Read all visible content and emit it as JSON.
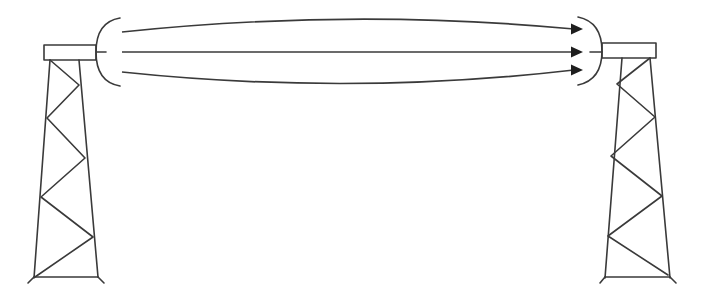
{
  "diagram": {
    "title": "",
    "colors": {
      "line": "#3a3a3a",
      "arrowhead": "#1e1e1e",
      "background": "#ffffff"
    },
    "left_tower": {
      "role": "transmitter-tower",
      "crossarm": {
        "x": 44,
        "y": 45,
        "w": 52,
        "h": 15
      },
      "legs": [
        [
          50,
          60,
          34,
          278
        ],
        [
          79,
          60,
          98,
          277
        ]
      ],
      "base": [
        34,
        277,
        98,
        277
      ],
      "feet": [
        [
          34,
          277,
          28,
          283
        ],
        [
          98,
          277,
          104,
          283
        ]
      ],
      "lattice_zigzag": [
        [
          50,
          60
        ],
        [
          79,
          85
        ],
        [
          47,
          118
        ],
        [
          85,
          158
        ],
        [
          41,
          197
        ],
        [
          93,
          237
        ],
        [
          35,
          277
        ]
      ]
    },
    "left_emitter": {
      "role": "transmitter-dish",
      "arc_path": "M120 18 Q96 22 96 52 Q96 82 120 86",
      "feed_dash": [
        97,
        52,
        106,
        52
      ],
      "mount_lines": [
        [
          96,
          46,
          100,
          46
        ],
        [
          96,
          58,
          100,
          58
        ]
      ]
    },
    "beams": [
      {
        "name": "upper-beam",
        "path": "M122 32 Q350 8 574 29",
        "tip": [
          583,
          29
        ]
      },
      {
        "name": "center-beam",
        "path": "M122 52 L574 52",
        "tip": [
          583,
          52
        ]
      },
      {
        "name": "lower-beam",
        "path": "M122 72 Q350 96 574 70",
        "tip": [
          583,
          70
        ]
      }
    ],
    "right_receiver": {
      "role": "receiver-dish",
      "arc_path": "M578 17 Q602 22 602 51 Q602 80 578 85",
      "feed_dash": [
        590,
        52,
        602,
        52
      ]
    },
    "right_tower": {
      "role": "receiver-tower",
      "crossarm": {
        "x": 602,
        "y": 43,
        "w": 54,
        "h": 15
      },
      "legs": [
        [
          622,
          58,
          605,
          278
        ],
        [
          650,
          58,
          670,
          278
        ]
      ],
      "base": [
        605,
        277,
        670,
        277
      ],
      "feet": [
        [
          605,
          277,
          600,
          283
        ],
        [
          670,
          277,
          676,
          283
        ]
      ],
      "lattice_zigzag": [
        [
          650,
          58
        ],
        [
          617,
          84
        ],
        [
          655,
          117
        ],
        [
          611,
          156
        ],
        [
          662,
          196
        ],
        [
          608,
          236
        ],
        [
          668,
          275
        ]
      ]
    }
  }
}
